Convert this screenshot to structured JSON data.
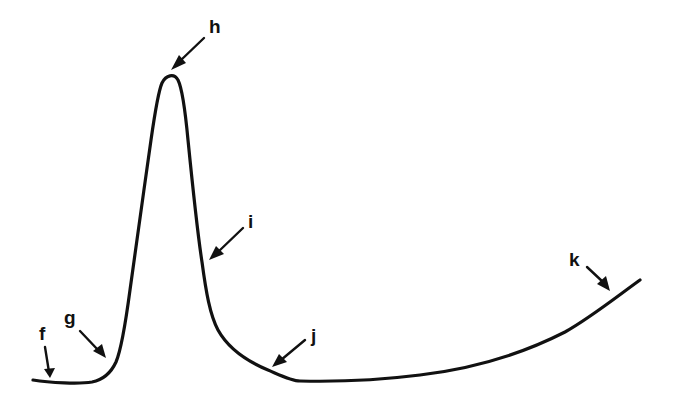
{
  "diagram": {
    "type": "labeled-curve",
    "colors": {
      "background": "#ffffff",
      "ink": "#111111"
    },
    "labels": [
      {
        "id": "f",
        "text": "f",
        "description": "initial flat baseline"
      },
      {
        "id": "g",
        "text": "g",
        "description": "steep rising phase"
      },
      {
        "id": "h",
        "text": "h",
        "description": "peak"
      },
      {
        "id": "i",
        "text": "i",
        "description": "rapid falling phase"
      },
      {
        "id": "j",
        "text": "j",
        "description": "trough / minimum"
      },
      {
        "id": "k",
        "text": "k",
        "description": "slow gradual rise"
      }
    ],
    "curve_points": [
      [
        33,
        380
      ],
      [
        60,
        383
      ],
      [
        92,
        382
      ],
      [
        108,
        372
      ],
      [
        118,
        355
      ],
      [
        124,
        330
      ],
      [
        130,
        290
      ],
      [
        138,
        240
      ],
      [
        146,
        190
      ],
      [
        153,
        140
      ],
      [
        159,
        100
      ],
      [
        164,
        82
      ],
      [
        172,
        76
      ],
      [
        178,
        80
      ],
      [
        183,
        100
      ],
      [
        188,
        140
      ],
      [
        194,
        190
      ],
      [
        199,
        235
      ],
      [
        205,
        275
      ],
      [
        212,
        310
      ],
      [
        224,
        338
      ],
      [
        240,
        356
      ],
      [
        265,
        368
      ],
      [
        295,
        380
      ],
      [
        340,
        380
      ],
      [
        400,
        377
      ],
      [
        460,
        368
      ],
      [
        520,
        350
      ],
      [
        575,
        318
      ],
      [
        640,
        280
      ]
    ]
  }
}
